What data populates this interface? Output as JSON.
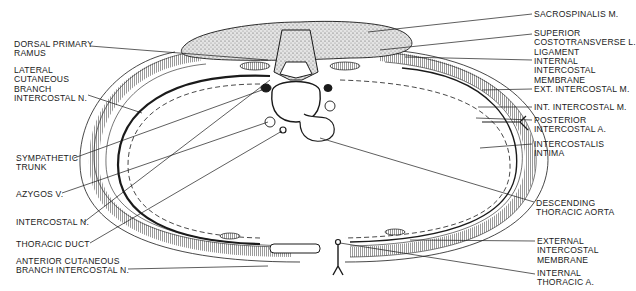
{
  "figure": {
    "type": "anatomical-line-diagram",
    "colors": {
      "ink": "#1a1a1a",
      "background": "#ffffff",
      "stipple": "#8a8a8a"
    }
  },
  "labels_left": [
    {
      "id": "dorsal-primary-ramus",
      "text": "DORSAL PRIMARY\nRAMUS",
      "x": 14,
      "y": 40
    },
    {
      "id": "lateral-cutaneous-branch",
      "text": "LATERAL\nCUTANEOUS\nBRANCH\nINTERCOSTAL N.",
      "x": 14,
      "y": 66
    },
    {
      "id": "sympathetic-trunk",
      "text": "SYMPATHETIC\nTRUNK",
      "x": 16,
      "y": 154
    },
    {
      "id": "azygos-v",
      "text": "AZYGOS V.",
      "x": 16,
      "y": 190
    },
    {
      "id": "intercostal-n",
      "text": "INTERCOSTAL N.",
      "x": 16,
      "y": 218
    },
    {
      "id": "thoracic-duct",
      "text": "THORACIC DUCT",
      "x": 16,
      "y": 240
    },
    {
      "id": "anterior-cutaneous-branch",
      "text": "ANTERIOR CUTANEOUS\nBRANCH INTERCOSTAL N.",
      "x": 16,
      "y": 257
    }
  ],
  "labels_right": [
    {
      "id": "sacrospinalis-m",
      "text": "SACROSPINALIS M.",
      "x": 534,
      "y": 10
    },
    {
      "id": "superior-costotransverse-ligament",
      "text": "SUPERIOR\nCOSTOTRANSVERSE L.\nLIGAMENT",
      "x": 534,
      "y": 29
    },
    {
      "id": "internal-intercostal-membrane",
      "text": "INTERNAL\nINTERCOSTAL\nMEMBRANE",
      "x": 534,
      "y": 57
    },
    {
      "id": "ext-intercostal-m",
      "text": "EXT. INTERCOSTAL M.",
      "x": 534,
      "y": 85
    },
    {
      "id": "int-intercostal-m",
      "text": "INT. INTERCOSTAL M.",
      "x": 534,
      "y": 103
    },
    {
      "id": "posterior-intercostal-a",
      "text": "POSTERIOR\nINTERCOSTAL A.",
      "x": 534,
      "y": 116
    },
    {
      "id": "intercostalis-intima",
      "text": "INTERCOSTALIS\nINTIMA",
      "x": 534,
      "y": 140
    },
    {
      "id": "descending-thoracic-aorta",
      "text": "DESCENDING\nTHORACIC AORTA",
      "x": 536,
      "y": 199
    },
    {
      "id": "external-intercostal-membrane",
      "text": "EXTERNAL\nINTERCOSTAL\nMEMBRANE",
      "x": 537,
      "y": 237
    },
    {
      "id": "internal-thoracic-a",
      "text": "INTERNAL\nTHORACIC A.",
      "x": 537,
      "y": 269
    }
  ]
}
